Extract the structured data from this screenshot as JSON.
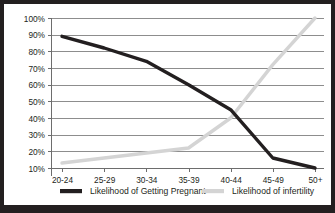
{
  "chart_data": {
    "type": "line",
    "title": "",
    "subtitle": "",
    "xlabel": "",
    "ylabel": "",
    "categories": [
      "20-24",
      "25-29",
      "30-34",
      "35-39",
      "40-44",
      "45-49",
      "50+"
    ],
    "ylim": [
      0,
      100
    ],
    "y_ticks": [
      "10%",
      "20%",
      "30%",
      "40%",
      "50%",
      "60%",
      "70%",
      "80%",
      "90%",
      "100%"
    ],
    "y_tick_values": [
      10,
      20,
      30,
      40,
      50,
      60,
      70,
      80,
      90,
      100
    ],
    "grid": true,
    "legend_position": "bottom",
    "series": [
      {
        "name": "Likelihood of Getting Pregnant",
        "color": "#231f20",
        "values": [
          89,
          82,
          74,
          60,
          45,
          16,
          10
        ]
      },
      {
        "name": "Likelihood of infertility",
        "color": "#d4d4d4",
        "values": [
          13,
          16,
          19,
          22,
          40,
          72,
          100
        ]
      }
    ]
  },
  "legend": {
    "items": [
      {
        "label": "Likelihood of Getting Pregnant",
        "color": "#231f20"
      },
      {
        "label": "Likelihood of infertility",
        "color": "#d4d4d4"
      }
    ]
  },
  "colors": {
    "background": "#ffffff",
    "border": "#231f20",
    "gridline": "#8d8d8d",
    "axis": "#6d6d6d",
    "text": "#231f20"
  }
}
